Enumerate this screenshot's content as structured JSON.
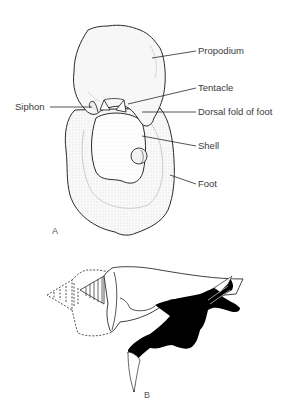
{
  "figure": {
    "panel_a": {
      "letter": "A",
      "labels": {
        "propodium": "Propodium",
        "tentacle": "Tentacle",
        "siphon": "Siphon",
        "dorsal_fold": "Dorsal fold of foot",
        "shell": "Shell",
        "foot": "Foot"
      }
    },
    "panel_b": {
      "letter": "B"
    },
    "colors": {
      "line": "#2a2a2a",
      "label": "#3a3a3a",
      "fill_black": "#000000",
      "stipple": "#d9d9d9"
    }
  }
}
